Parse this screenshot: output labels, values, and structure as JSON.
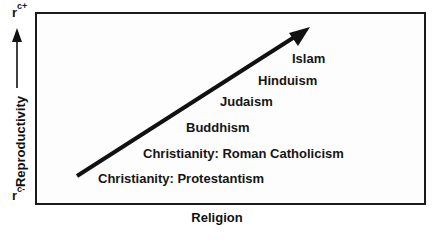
{
  "diagram": {
    "y_axis": {
      "label": "Reproductivity",
      "top_label": "r",
      "top_sup": "c+",
      "bottom_label": "r",
      "bottom_sup": "c-"
    },
    "x_axis": {
      "label": "Religion"
    },
    "items": [
      {
        "label": "Islam"
      },
      {
        "label": "Hinduism"
      },
      {
        "label": "Judaism"
      },
      {
        "label": "Buddhism"
      },
      {
        "label": "Christianity:  Roman Catholicism"
      },
      {
        "label": "Christianity:  Protestantism"
      }
    ],
    "colors": {
      "ink": "#111111",
      "background": "#ffffff"
    }
  }
}
